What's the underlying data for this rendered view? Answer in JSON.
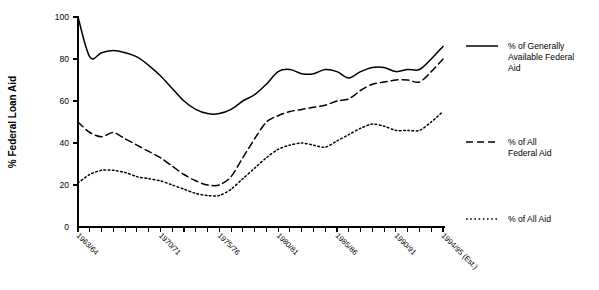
{
  "chart_data": {
    "type": "line",
    "title": "",
    "xlabel": "",
    "ylabel": "% Federal Loan Aid",
    "ylim": [
      0,
      100
    ],
    "yticks": [
      0,
      20,
      40,
      60,
      80,
      100
    ],
    "ytick_labels": [
      "0",
      "20",
      "40",
      "60",
      "80",
      "100"
    ],
    "grid": false,
    "legend_position": "right",
    "x": [
      "1963/64",
      "1964/65",
      "1965/66",
      "1966/67",
      "1967/68",
      "1968/69",
      "1969/70",
      "1970/71",
      "1971/72",
      "1972/73",
      "1973/74",
      "1974/75",
      "1975/76",
      "1976/77",
      "1977/78",
      "1978/79",
      "1979/80",
      "1980/81",
      "1981/82",
      "1982/83",
      "1983/84",
      "1984/85",
      "1985/86",
      "1986/87",
      "1987/88",
      "1988/89",
      "1989/90",
      "1990/91",
      "1991/92",
      "1992/93",
      "1993/94",
      "1994/95 (Est.)"
    ],
    "xtick_labels": [
      "1963/64",
      "1970/71",
      "1975/76",
      "1980/81",
      "1985/86",
      "1990/91",
      "1994/95 (Est.)"
    ],
    "xtick_label_indices": [
      0,
      7,
      12,
      17,
      22,
      27,
      31
    ],
    "series": [
      {
        "name": "% of Generally Available Federal Aid",
        "style": "solid",
        "values": [
          100,
          81,
          83,
          84,
          83,
          81,
          77,
          72,
          66,
          60,
          56,
          54,
          54,
          56,
          60,
          63,
          68,
          74,
          75,
          73,
          73,
          75,
          74,
          71,
          74,
          76,
          76,
          74,
          75,
          75,
          80,
          86
        ]
      },
      {
        "name": "% of All Federal Aid",
        "style": "dashed",
        "values": [
          50,
          45,
          43,
          45,
          42,
          39,
          36,
          33,
          29,
          25,
          22,
          20,
          20,
          24,
          33,
          42,
          50,
          53,
          55,
          56,
          57,
          58,
          60,
          61,
          65,
          68,
          69,
          70,
          70,
          69,
          74,
          80
        ]
      },
      {
        "name": "% of All Aid",
        "style": "dotted",
        "values": [
          21,
          25,
          27,
          27,
          26,
          24,
          23,
          22,
          20,
          18,
          16,
          15,
          15,
          18,
          23,
          28,
          33,
          37,
          39,
          40,
          39,
          38,
          41,
          44,
          47,
          49,
          48,
          46,
          46,
          46,
          50,
          55
        ]
      }
    ]
  },
  "legend": {
    "items": [
      {
        "label": "% of Generally Available Federal Aid",
        "style": "solid"
      },
      {
        "label": "% of All Federal Aid",
        "style": "dashed"
      },
      {
        "label": "% of All Aid",
        "style": "dotted"
      }
    ]
  }
}
